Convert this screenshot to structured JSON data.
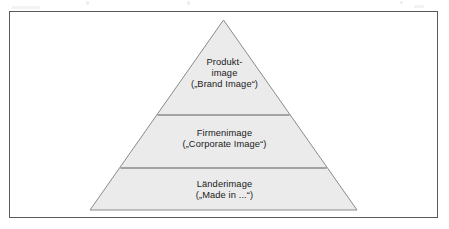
{
  "figure": {
    "type": "pyramid-diagram",
    "tier_count": 3,
    "colors": {
      "frame_border": "#575b5e",
      "pyramid_fill": "#ebebeb",
      "pyramid_stroke": "#8a8a8a",
      "divider_stroke": "#5a5a5a",
      "text": "#1a1a1a",
      "background": "#ffffff"
    },
    "tiers": [
      {
        "id": "top",
        "position": 1,
        "term_line1": "Produkt-",
        "term_line2": "image",
        "translation": "(„Brand Image“)"
      },
      {
        "id": "middle",
        "position": 2,
        "term_line1": "Firmenimage",
        "translation": "(„Corporate Image“)"
      },
      {
        "id": "bottom",
        "position": 3,
        "term_line1": "Länderimage",
        "translation": "(„Made in ...“)"
      }
    ]
  }
}
